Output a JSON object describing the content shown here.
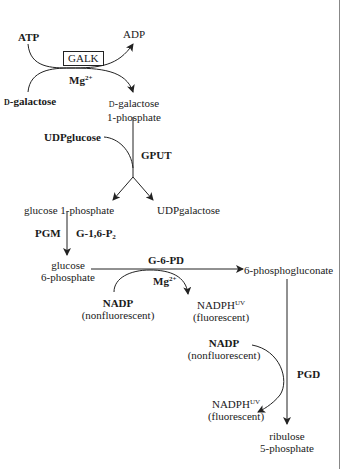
{
  "diagram": {
    "type": "metabolic-pathway",
    "colors": {
      "line": "#222222",
      "text": "#1a1a1a",
      "background": "#ffffff",
      "edge": "#888888"
    },
    "step1": {
      "cofactor_in": "ATP",
      "cofactor_out": "ADP",
      "enzyme": "GALK",
      "ion": "Mg",
      "ion_charge": "2+",
      "substrate": "D-galactose",
      "substrate_prefix": "D",
      "substrate_name": "-galactose",
      "product_line1_prefix": "D",
      "product_line1": "-galactose",
      "product_line2": "1-phosphate"
    },
    "step2": {
      "cosubstrate": "UDPglucose",
      "enzyme": "GPUT",
      "product_left": "glucose 1-phosphate",
      "product_right": "UDPgalactose"
    },
    "step3": {
      "enzyme": "PGM",
      "cofactor": "G-1,6-P",
      "cofactor_sub": "2",
      "product_line1": "glucose",
      "product_line2": "6-phosphate"
    },
    "step4": {
      "enzyme": "G-6-PD",
      "ion": "Mg",
      "ion_charge": "2+",
      "cofactor_in": "NADP",
      "cofactor_in_note": "(nonfluorescent)",
      "cofactor_out": "NADPH",
      "cofactor_out_sup": "UV",
      "cofactor_out_note": "(fluorescent)",
      "product": "6-phosphogluconate"
    },
    "step5": {
      "enzyme": "PGD",
      "cofactor_in": "NADP",
      "cofactor_in_note": "(nonfluorescent)",
      "cofactor_out": "NADPH",
      "cofactor_out_sup": "UV",
      "cofactor_out_note": "(fluorescent)",
      "product_line1": "ribulose",
      "product_line2": "5-phosphate"
    }
  }
}
